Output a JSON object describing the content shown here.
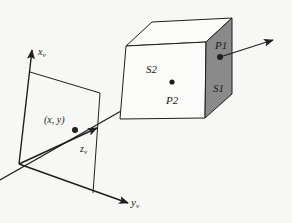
{
  "diagram": {
    "colors": {
      "line": "#1f1f1f",
      "shaded_face": "#8a8a8a",
      "background": "#f7f7f5"
    },
    "labels": {
      "x_axis": "x",
      "x_axis_sub": "v",
      "y_axis": "y",
      "y_axis_sub": "v",
      "z_axis": "z",
      "z_axis_sub": "v",
      "image_point": "(x, y)",
      "surface_front": "S2",
      "surface_side": "S1",
      "point_front": "P2",
      "point_side": "P1"
    }
  }
}
